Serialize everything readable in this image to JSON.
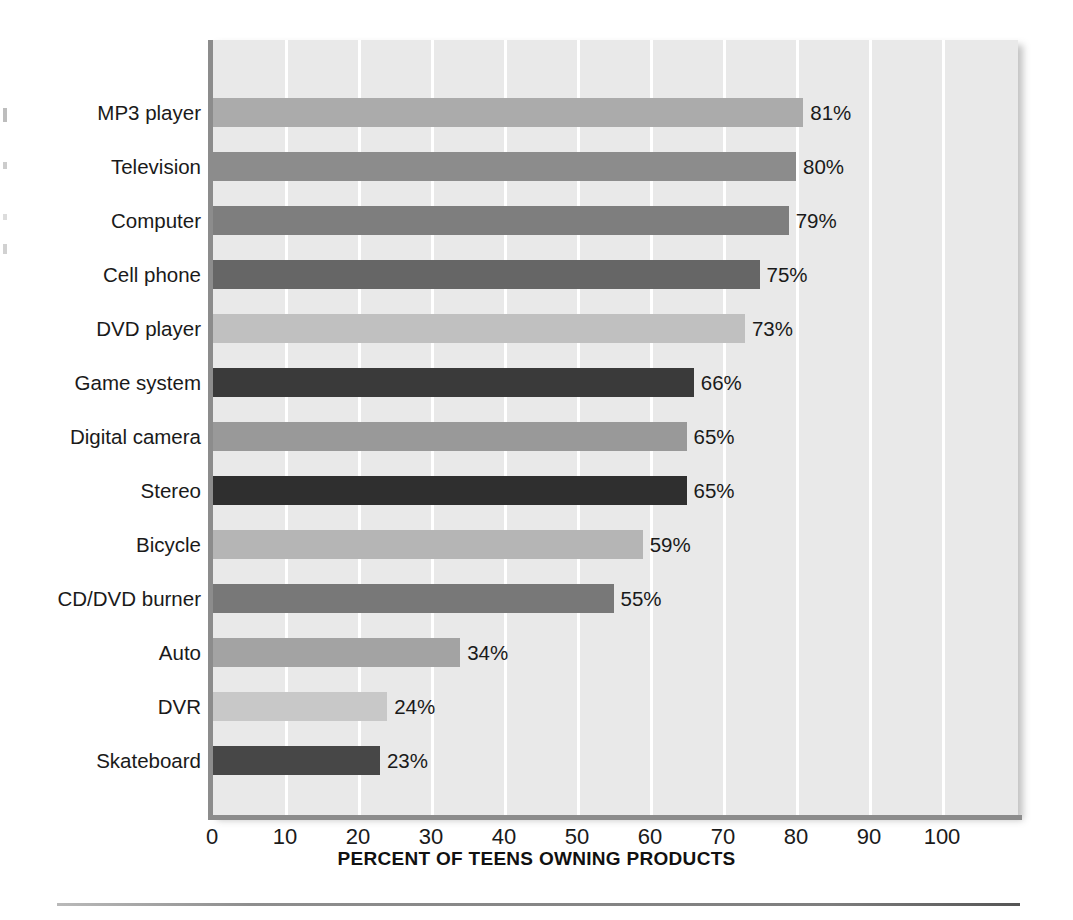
{
  "chart_data": {
    "type": "bar",
    "orientation": "horizontal",
    "title": "",
    "xlabel": "PERCENT OF TEENS OWNING PRODUCTS",
    "ylabel": "",
    "xlim": [
      0,
      110
    ],
    "xticks": [
      0,
      10,
      20,
      30,
      40,
      50,
      60,
      70,
      80,
      90,
      100
    ],
    "xtick_labels": [
      "0",
      "10",
      "20",
      "30",
      "40",
      "50",
      "60",
      "70",
      "80",
      "90",
      "100"
    ],
    "grid": "vertical-white-gridlines",
    "legend": "none",
    "value_label_suffix": "%",
    "categories": [
      "MP3 player",
      "Television",
      "Computer",
      "Cell phone",
      "DVD player",
      "Game system",
      "Digital camera",
      "Stereo",
      "Bicycle",
      "CD/DVD burner",
      "Auto",
      "DVR",
      "Skateboard"
    ],
    "values": [
      81,
      80,
      79,
      75,
      73,
      66,
      65,
      65,
      59,
      55,
      34,
      24,
      23
    ],
    "value_labels": [
      "81%",
      "80%",
      "79%",
      "75%",
      "73%",
      "66%",
      "65%",
      "65%",
      "59%",
      "55%",
      "34%",
      "24%",
      "23%"
    ],
    "bar_colors": [
      "#ababab",
      "#8c8c8c",
      "#7e7e7e",
      "#666666",
      "#c0c0c0",
      "#3a3a3a",
      "#999999",
      "#2f2f2f",
      "#b5b5b5",
      "#787878",
      "#a3a3a3",
      "#c8c8c8",
      "#474747"
    ],
    "bars": [
      {
        "category": "MP3 player",
        "value": 81,
        "label": "81%",
        "color": "#ababab"
      },
      {
        "category": "Television",
        "value": 80,
        "label": "80%",
        "color": "#8c8c8c"
      },
      {
        "category": "Computer",
        "value": 79,
        "label": "79%",
        "color": "#7e7e7e"
      },
      {
        "category": "Cell phone",
        "value": 75,
        "label": "75%",
        "color": "#666666"
      },
      {
        "category": "DVD player",
        "value": 73,
        "label": "73%",
        "color": "#c0c0c0"
      },
      {
        "category": "Game system",
        "value": 66,
        "label": "66%",
        "color": "#3a3a3a"
      },
      {
        "category": "Digital camera",
        "value": 65,
        "label": "65%",
        "color": "#999999"
      },
      {
        "category": "Stereo",
        "value": 65,
        "label": "65%",
        "color": "#2f2f2f"
      },
      {
        "category": "Bicycle",
        "value": 59,
        "label": "59%",
        "color": "#b5b5b5"
      },
      {
        "category": "CD/DVD burner",
        "value": 55,
        "label": "55%",
        "color": "#787878"
      },
      {
        "category": "Auto",
        "value": 34,
        "label": "34%",
        "color": "#a3a3a3"
      },
      {
        "category": "DVR",
        "value": 24,
        "label": "24%",
        "color": "#c8c8c8"
      },
      {
        "category": "Skateboard",
        "value": 23,
        "label": "23%",
        "color": "#474747"
      }
    ],
    "plot_background": "#e9e9e9",
    "gridline_color": "#ffffff",
    "axis_color": "#8c8c8c"
  }
}
